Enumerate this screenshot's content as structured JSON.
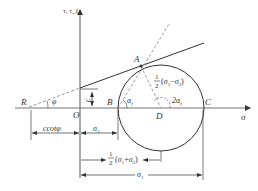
{
  "diagram": {
    "type": "Mohr circle with Mohr-Coulomb failure envelope",
    "axes": {
      "y_label": "τ, τ_f",
      "x_label": "σ",
      "origin_label": "O"
    },
    "points": {
      "R": "R",
      "A": "A",
      "B": "B",
      "C": "C",
      "D": "D"
    },
    "angles": {
      "phi": "φ",
      "alpha_f": "α_f",
      "two_alpha_f": "2α_f"
    },
    "labels": {
      "cohesion": "c",
      "radius_label_frac": "1/2",
      "radius_label_expr": "(σ₁−σ₃)",
      "c_cot_phi": "ccotφ",
      "sigma3": "σ₃",
      "center_frac": "1/2",
      "center_expr": "(σ₁+σ₃)",
      "sigma1": "σ₁"
    },
    "colors": {
      "line": "#333333",
      "dashed": "#777777",
      "background": "#ffffff"
    }
  }
}
